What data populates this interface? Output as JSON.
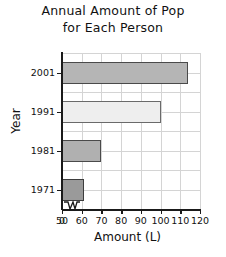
{
  "chart_data": {
    "type": "bar",
    "orientation": "horizontal",
    "title": "Annual Amount of Pop for Each Person",
    "title_lines": [
      "Annual Amount of Pop",
      "for Each Person"
    ],
    "categories": [
      "2001",
      "1991",
      "1981",
      "1971"
    ],
    "values": [
      114,
      100,
      70,
      61
    ],
    "xlabel": "Amount (L)",
    "ylabel": "Year",
    "xlim": [
      50,
      120
    ],
    "axis_break": true,
    "axis_break_note": "zigzag break on x-axis between 0 and 50",
    "xticks": [
      "0",
      "50",
      "60",
      "70",
      "80",
      "90",
      "100",
      "110",
      "120"
    ],
    "xtick_values": [
      0,
      50,
      60,
      70,
      80,
      90,
      100,
      110,
      120
    ],
    "grid": true,
    "legend": "none",
    "bars": [
      {
        "category": "2001",
        "value": 114,
        "color": "#b5b5b5",
        "border": "#4a4a4a"
      },
      {
        "category": "1991",
        "value": 100,
        "color": "#eeeeee",
        "border": "#6a6a6a"
      },
      {
        "category": "1981",
        "value": 70,
        "color": "#b0b0b0",
        "border": "#4a4a4a"
      },
      {
        "category": "1971",
        "value": 61,
        "color": "#9a9a9a",
        "border": "#3d3d3d"
      }
    ]
  },
  "style": {
    "background": "#ffffff",
    "grid_color": "#d4d4d4",
    "axis_color": "#1a1a1a",
    "text_color": "#111111"
  }
}
